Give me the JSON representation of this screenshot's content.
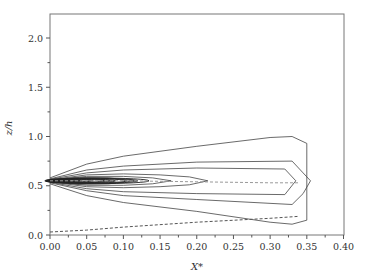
{
  "chart_data": {
    "type": "contour",
    "title": "",
    "xlabel": "X*",
    "ylabel": "z/h",
    "xlim": [
      0.0,
      0.4
    ],
    "ylim": [
      0.0,
      2.2
    ],
    "x_ticks": [
      "0.00",
      "0.05",
      "0.10",
      "0.15",
      "0.20",
      "0.25",
      "0.30",
      "0.35",
      "0.40"
    ],
    "y_ticks": [
      "0.0",
      "0.5",
      "1.0",
      "1.5",
      "2.0"
    ],
    "grid": false,
    "legend": null,
    "source_point": {
      "x": 0.0,
      "z": 0.55
    },
    "contours": [
      {
        "level": 1,
        "upper": [
          [
            0.0,
            0.58
          ],
          [
            0.05,
            0.72
          ],
          [
            0.1,
            0.8
          ],
          [
            0.2,
            0.9
          ],
          [
            0.3,
            0.99
          ],
          [
            0.33,
            1.0
          ],
          [
            0.35,
            0.93
          ]
        ],
        "lower": [
          [
            0.0,
            0.52
          ],
          [
            0.05,
            0.4
          ],
          [
            0.1,
            0.33
          ],
          [
            0.2,
            0.24
          ],
          [
            0.3,
            0.13
          ],
          [
            0.33,
            0.11
          ],
          [
            0.35,
            0.15
          ]
        ]
      },
      {
        "level": 2,
        "upper": [
          [
            0.0,
            0.57
          ],
          [
            0.05,
            0.66
          ],
          [
            0.1,
            0.7
          ],
          [
            0.2,
            0.74
          ],
          [
            0.33,
            0.75
          ],
          [
            0.345,
            0.63
          ],
          [
            0.355,
            0.55
          ]
        ],
        "lower": [
          [
            0.0,
            0.53
          ],
          [
            0.05,
            0.45
          ],
          [
            0.1,
            0.4
          ],
          [
            0.2,
            0.36
          ],
          [
            0.33,
            0.31
          ],
          [
            0.345,
            0.42
          ],
          [
            0.355,
            0.55
          ]
        ]
      },
      {
        "level": 3,
        "upper": [
          [
            0.0,
            0.565
          ],
          [
            0.05,
            0.63
          ],
          [
            0.1,
            0.66
          ],
          [
            0.2,
            0.68
          ],
          [
            0.32,
            0.67
          ],
          [
            0.335,
            0.55
          ]
        ],
        "lower": [
          [
            0.0,
            0.535
          ],
          [
            0.05,
            0.47
          ],
          [
            0.1,
            0.44
          ],
          [
            0.2,
            0.42
          ],
          [
            0.32,
            0.41
          ],
          [
            0.335,
            0.55
          ]
        ]
      },
      {
        "level": 4,
        "upper": [
          [
            0.0,
            0.56
          ],
          [
            0.05,
            0.61
          ],
          [
            0.1,
            0.62
          ],
          [
            0.15,
            0.61
          ],
          [
            0.19,
            0.59
          ],
          [
            0.215,
            0.55
          ]
        ],
        "lower": [
          [
            0.0,
            0.54
          ],
          [
            0.05,
            0.49
          ],
          [
            0.1,
            0.48
          ],
          [
            0.15,
            0.49
          ],
          [
            0.19,
            0.51
          ],
          [
            0.215,
            0.55
          ]
        ]
      },
      {
        "level": 5,
        "upper": [
          [
            0.0,
            0.56
          ],
          [
            0.05,
            0.595
          ],
          [
            0.1,
            0.595
          ],
          [
            0.14,
            0.58
          ],
          [
            0.165,
            0.55
          ]
        ],
        "lower": [
          [
            0.0,
            0.54
          ],
          [
            0.05,
            0.505
          ],
          [
            0.1,
            0.505
          ],
          [
            0.14,
            0.52
          ],
          [
            0.165,
            0.55
          ]
        ]
      },
      {
        "level": 6,
        "upper": [
          [
            0.0,
            0.555
          ],
          [
            0.04,
            0.585
          ],
          [
            0.08,
            0.58
          ],
          [
            0.115,
            0.55
          ]
        ],
        "lower": [
          [
            0.0,
            0.545
          ],
          [
            0.04,
            0.515
          ],
          [
            0.08,
            0.52
          ],
          [
            0.115,
            0.55
          ]
        ]
      },
      {
        "level": 7,
        "upper": [
          [
            0.0,
            0.555
          ],
          [
            0.03,
            0.575
          ],
          [
            0.06,
            0.57
          ],
          [
            0.085,
            0.55
          ]
        ],
        "lower": [
          [
            0.0,
            0.545
          ],
          [
            0.03,
            0.525
          ],
          [
            0.06,
            0.53
          ],
          [
            0.085,
            0.55
          ]
        ]
      }
    ],
    "dashed_lines": [
      {
        "name": "centerline",
        "points": [
          [
            0.0,
            0.55
          ],
          [
            0.1,
            0.55
          ],
          [
            0.2,
            0.54
          ],
          [
            0.3,
            0.53
          ],
          [
            0.34,
            0.53
          ]
        ]
      },
      {
        "name": "lower-boundary",
        "points": [
          [
            0.0,
            0.03
          ],
          [
            0.05,
            0.05
          ],
          [
            0.1,
            0.08
          ],
          [
            0.2,
            0.13
          ],
          [
            0.3,
            0.17
          ],
          [
            0.34,
            0.19
          ]
        ]
      }
    ]
  }
}
